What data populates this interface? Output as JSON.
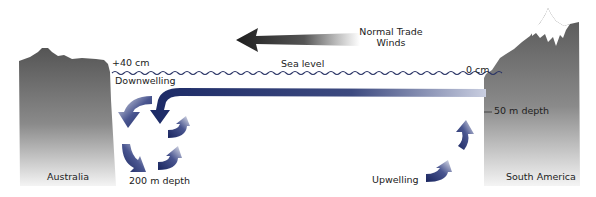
{
  "diagram": {
    "wind": {
      "label_line1": "Normal Trade",
      "label_line2": "Winds",
      "direction": "east-to-west"
    },
    "sea_level": {
      "label": "Sea level",
      "west_height": "+40 cm",
      "east_height": "0 cm"
    },
    "landmasses": {
      "west": "Australia",
      "east": "South America"
    },
    "processes": {
      "west": "Downwelling",
      "east": "Upwelling"
    },
    "depths": {
      "west": "200 m depth",
      "east": "50 m depth"
    },
    "colors": {
      "land_dark": "#555555",
      "land_light": "#f2f2f2",
      "current_dark": "#1c2a66",
      "current_light": "#d8dcea",
      "wave": "#2b3566",
      "wind_arrow": "#2a2a2a",
      "snow": "#ffffff"
    }
  }
}
